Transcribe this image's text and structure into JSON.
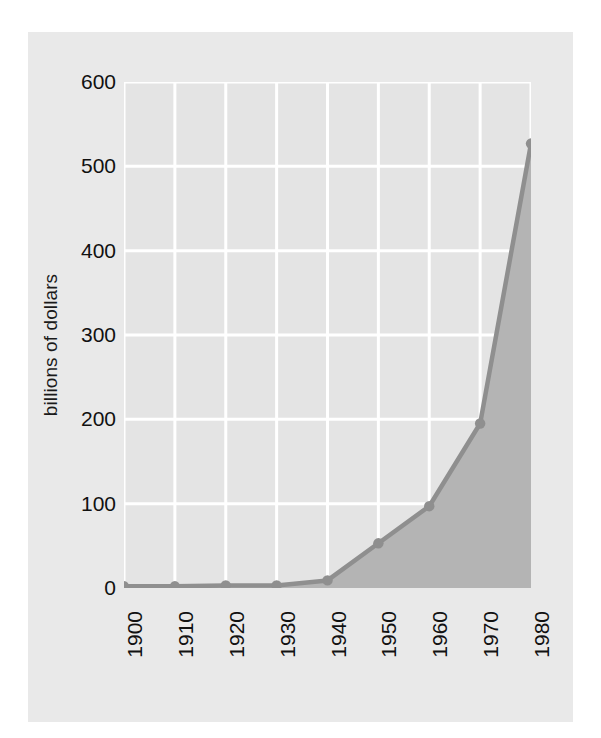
{
  "figure": {
    "panel_background": "#e9e9e9",
    "page_background": "#ffffff"
  },
  "axis_label": {
    "y": "billions of dollars"
  },
  "chart_data": {
    "type": "area",
    "title": "",
    "subtitle": "",
    "xlabel": "",
    "ylabel": "billions of dollars",
    "categories": [
      "1900",
      "1910",
      "1920",
      "1930",
      "1940",
      "1950",
      "1960",
      "1970",
      "1980"
    ],
    "x": [
      1900,
      1910,
      1920,
      1930,
      1940,
      1950,
      1960,
      1970,
      1980
    ],
    "values": [
      2,
      2,
      3,
      3,
      9,
      53,
      97,
      195,
      527
    ],
    "series": [
      {
        "name": "billions of dollars",
        "values": [
          2,
          2,
          3,
          3,
          9,
          53,
          97,
          195,
          527
        ]
      }
    ],
    "xlim": [
      1900,
      1980
    ],
    "ylim": [
      0,
      600
    ],
    "yticks": [
      0,
      100,
      200,
      300,
      400,
      500,
      600
    ],
    "ytick_labels": [
      "0",
      "100",
      "200",
      "300",
      "400",
      "500",
      "600"
    ],
    "xticks": [
      1900,
      1910,
      1920,
      1930,
      1940,
      1950,
      1960,
      1970,
      1980
    ],
    "xtick_labels": [
      "1900",
      "1910",
      "1920",
      "1930",
      "1940",
      "1950",
      "1960",
      "1970",
      "1980"
    ],
    "xtick_rotation": -90,
    "grid": true,
    "grid_color": "#ffffff",
    "legend": false,
    "legend_position": "none",
    "line_color": "#8f8f8f",
    "fill_color": "#b4b4b4",
    "marker": "circle",
    "marker_color": "#8f8f8f",
    "annotations": []
  }
}
